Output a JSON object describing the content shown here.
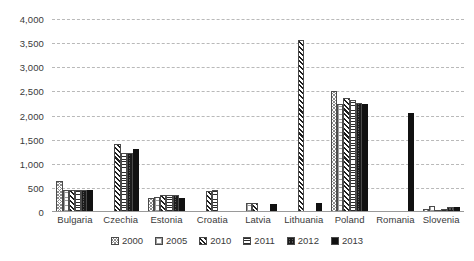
{
  "chart_data": {
    "type": "bar",
    "title": "",
    "subtitle": "",
    "xlabel": "",
    "ylabel": "",
    "ylim": [
      0,
      4000
    ],
    "ytick_step": 500,
    "yticks": [
      "0",
      "500",
      "1,000",
      "1,500",
      "2,000",
      "2,500",
      "3,000",
      "3,500",
      "4,000"
    ],
    "grid": true,
    "legend_position": "bottom",
    "categories": [
      "Bulgaria",
      "Czechia",
      "Estonia",
      "Croatia",
      "Latvia",
      "Lithuania",
      "Poland",
      "Romania",
      "Slovenia"
    ],
    "series": [
      {
        "name": "2000",
        "pattern": "light-cross-hatch",
        "values": [
          650,
          0,
          290,
          0,
          0,
          0,
          2500,
          0,
          60
        ]
      },
      {
        "name": "2005",
        "pattern": "light-grid-dots",
        "values": [
          450,
          0,
          320,
          0,
          190,
          0,
          2230,
          0,
          130
        ]
      },
      {
        "name": "2010",
        "pattern": "bold-diagonal-hatch",
        "values": [
          460,
          1400,
          345,
          430,
          180,
          3560,
          2360,
          0,
          40
        ]
      },
      {
        "name": "2011",
        "pattern": "horizontal-lines",
        "values": [
          455,
          1220,
          350,
          455,
          0,
          0,
          2330,
          0,
          55
        ]
      },
      {
        "name": "2012",
        "pattern": "dark-speckle",
        "values": [
          460,
          1215,
          360,
          0,
          0,
          0,
          2250,
          0,
          95
        ]
      },
      {
        "name": "2013",
        "pattern": "solid-black",
        "values": [
          465,
          1310,
          290,
          0,
          175,
          185,
          2235,
          2060,
          110
        ]
      }
    ]
  },
  "legend": {
    "items": [
      {
        "label": "2000"
      },
      {
        "label": "2005"
      },
      {
        "label": "2010"
      },
      {
        "label": "2011"
      },
      {
        "label": "2012"
      },
      {
        "label": "2013"
      }
    ]
  }
}
